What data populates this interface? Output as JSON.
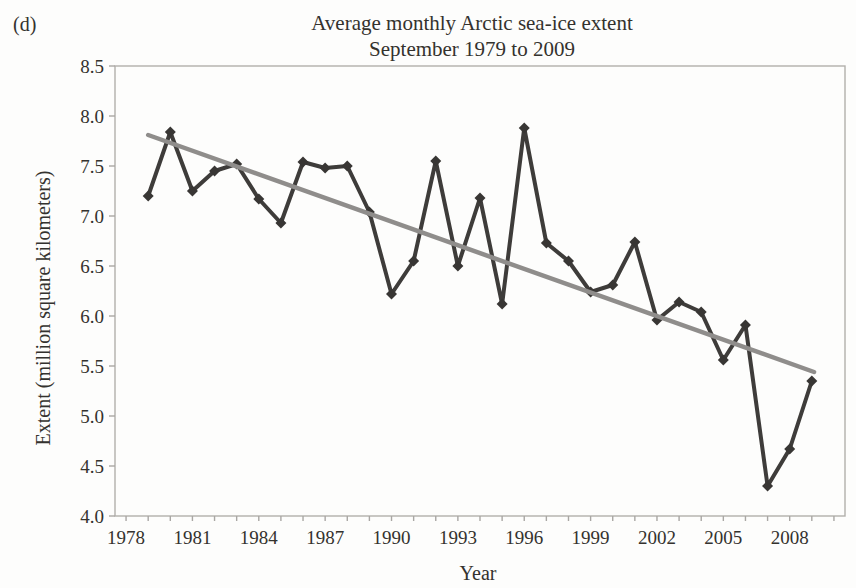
{
  "figure_label": "(d)",
  "colors": {
    "series_line": "#3e3c3a",
    "marker_fill": "#383634",
    "trend_line": "#8f8d8b",
    "frame": "#b1afac",
    "tick_mark": "#a9a7a4",
    "text": "#34322e",
    "background": "#fdfdfc"
  },
  "chart_data": {
    "type": "line",
    "title": "Average monthly Arctic sea-ice extent",
    "subtitle": "September 1979 to 2009",
    "xlabel": "Year",
    "ylabel": "Extent (million square kilometers)",
    "xlim": [
      1977.5,
      2010.5
    ],
    "ylim": [
      4.0,
      8.5
    ],
    "grid": false,
    "legend": "none",
    "x_ticks_labeled": [
      1978,
      1981,
      1984,
      1987,
      1990,
      1993,
      1996,
      1999,
      2002,
      2005,
      2008
    ],
    "x_minor_tick_range": [
      1978,
      2010
    ],
    "x_minor_tick_step": 1,
    "y_ticks": [
      4.0,
      4.5,
      5.0,
      5.5,
      6.0,
      6.5,
      7.0,
      7.5,
      8.0,
      8.5
    ],
    "x": [
      1979,
      1980,
      1981,
      1982,
      1983,
      1984,
      1985,
      1986,
      1987,
      1988,
      1989,
      1990,
      1991,
      1992,
      1993,
      1994,
      1995,
      1996,
      1997,
      1998,
      1999,
      2000,
      2001,
      2002,
      2003,
      2004,
      2005,
      2006,
      2007,
      2008,
      2009
    ],
    "series": [
      {
        "name": "September average sea-ice extent",
        "marker": "diamond",
        "values": [
          7.2,
          7.84,
          7.25,
          7.45,
          7.52,
          7.17,
          6.93,
          7.54,
          7.48,
          7.5,
          7.04,
          6.22,
          6.55,
          7.55,
          6.5,
          7.18,
          6.12,
          7.88,
          6.73,
          6.55,
          6.24,
          6.31,
          6.74,
          5.96,
          6.14,
          6.04,
          5.56,
          5.91,
          4.3,
          4.67,
          5.35
        ]
      }
    ],
    "trendline": {
      "name": "linear trend",
      "x1": 1979,
      "y1": 7.81,
      "x2": 2009.1,
      "y2": 5.44
    }
  }
}
